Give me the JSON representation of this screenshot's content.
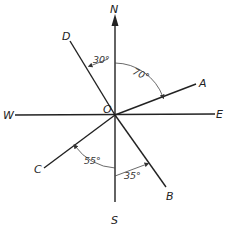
{
  "diagram": {
    "title": "",
    "origin_label": "O",
    "compass": {
      "north": "N",
      "south": "S",
      "east": "E",
      "west": "W"
    },
    "vectors": [
      {
        "label": "A",
        "bearing": "70° east of north"
      },
      {
        "label": "B",
        "bearing": "35° east of south"
      },
      {
        "label": "C",
        "bearing": "55° west of south"
      },
      {
        "label": "D",
        "bearing": "30° west of north"
      }
    ],
    "angles": {
      "d_from_n": "30°",
      "a_from_n": "70°",
      "c_from_s": "55°",
      "b_from_s": "35°"
    },
    "colors": {
      "line": "#222222",
      "background": "#ffffff"
    }
  }
}
